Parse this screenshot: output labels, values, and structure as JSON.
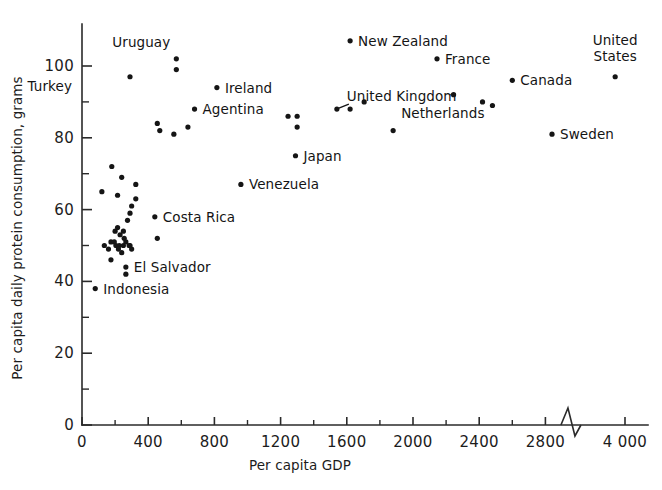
{
  "chart_data": {
    "type": "scatter",
    "title": "",
    "xlabel": "Per capita GDP",
    "ylabel": "Per capita daily protein consumption, grams",
    "xlim": [
      0,
      4000
    ],
    "ylim": [
      0,
      108
    ],
    "grid": false,
    "legend": null,
    "axis_break": {
      "axis": "x",
      "between": [
        2900,
        3700
      ],
      "style": "zigzag"
    },
    "xticks": [
      0,
      400,
      800,
      1200,
      1600,
      2000,
      2400,
      2800,
      4000
    ],
    "xtick_labels": [
      "0",
      "400",
      "800",
      "1200",
      "1600",
      "2000",
      "2400",
      "2800",
      "4 000"
    ],
    "xticks_minor": [
      200,
      600,
      1000,
      1400,
      1800,
      2200,
      2600
    ],
    "yticks": [
      0,
      20,
      40,
      60,
      80,
      100
    ],
    "ytick_labels": [
      "0",
      "20",
      "40",
      "60",
      "80",
      "100"
    ],
    "yticks_minor": [
      10,
      30,
      50,
      70,
      90
    ],
    "labeled_points": [
      {
        "label": "Turkey",
        "x": 290,
        "y": 97,
        "label_dx": -58,
        "label_dy": 14,
        "leader": false
      },
      {
        "label": "Uruguay",
        "x": 570,
        "y": 102,
        "label_dx": -6,
        "label_dy": -12,
        "leader": false
      },
      {
        "label": "Ireland",
        "x": 815,
        "y": 94,
        "label_dx": 8,
        "label_dy": 5,
        "leader": false
      },
      {
        "label": "Agentina",
        "x": 680,
        "y": 88,
        "label_dx": 8,
        "label_dy": 5,
        "leader": false
      },
      {
        "label": "Costa Rica",
        "x": 440,
        "y": 58,
        "label_dx": 8,
        "label_dy": 5,
        "leader": false
      },
      {
        "label": "El Salvador",
        "x": 265,
        "y": 44,
        "label_dx": 8,
        "label_dy": 5,
        "leader": false
      },
      {
        "label": "Indonesia",
        "x": 80,
        "y": 38,
        "label_dx": 8,
        "label_dy": 5,
        "leader": false
      },
      {
        "label": "Venezuela",
        "x": 960,
        "y": 67,
        "label_dx": 8,
        "label_dy": 5,
        "leader": false
      },
      {
        "label": "Japan",
        "x": 1290,
        "y": 75,
        "label_dx": 8,
        "label_dy": 5,
        "leader": false
      },
      {
        "label": "United Kingdom",
        "x": 1540,
        "y": 88,
        "label_dx": 10,
        "label_dy": -8,
        "leader": true
      },
      {
        "label": "Netherlands",
        "x": 1880,
        "y": 82,
        "label_dx": 8,
        "label_dy": -13,
        "leader": false
      },
      {
        "label": "New Zealand",
        "x": 1620,
        "y": 107,
        "label_dx": 8,
        "label_dy": 5,
        "leader": false
      },
      {
        "label": "France",
        "x": 2145,
        "y": 102,
        "label_dx": 8,
        "label_dy": 5,
        "leader": false
      },
      {
        "label": "Canada",
        "x": 2600,
        "y": 96,
        "label_dx": 8,
        "label_dy": 5,
        "leader": false
      },
      {
        "label": "Sweden",
        "x": 2840,
        "y": 81,
        "label_dx": 8,
        "label_dy": 5,
        "leader": false
      },
      {
        "label": "United States",
        "x": 3760,
        "y": 97,
        "label_dx": 0,
        "label_dy": -16,
        "leader": false
      }
    ],
    "unlabeled_points": [
      {
        "x": 570,
        "y": 99
      },
      {
        "x": 455,
        "y": 84
      },
      {
        "x": 470,
        "y": 82
      },
      {
        "x": 555,
        "y": 81
      },
      {
        "x": 640,
        "y": 83
      },
      {
        "x": 1245,
        "y": 86
      },
      {
        "x": 1300,
        "y": 86
      },
      {
        "x": 1300,
        "y": 83
      },
      {
        "x": 1620,
        "y": 88
      },
      {
        "x": 1705,
        "y": 90
      },
      {
        "x": 2245,
        "y": 92
      },
      {
        "x": 2420,
        "y": 90
      },
      {
        "x": 2480,
        "y": 89
      },
      {
        "x": 180,
        "y": 72
      },
      {
        "x": 240,
        "y": 69
      },
      {
        "x": 120,
        "y": 65
      },
      {
        "x": 215,
        "y": 64
      },
      {
        "x": 300,
        "y": 61
      },
      {
        "x": 325,
        "y": 67
      },
      {
        "x": 325,
        "y": 63
      },
      {
        "x": 290,
        "y": 59
      },
      {
        "x": 275,
        "y": 57
      },
      {
        "x": 200,
        "y": 54
      },
      {
        "x": 215,
        "y": 55
      },
      {
        "x": 230,
        "y": 53
      },
      {
        "x": 250,
        "y": 54
      },
      {
        "x": 255,
        "y": 52
      },
      {
        "x": 175,
        "y": 51
      },
      {
        "x": 195,
        "y": 51
      },
      {
        "x": 205,
        "y": 50
      },
      {
        "x": 225,
        "y": 50
      },
      {
        "x": 250,
        "y": 50
      },
      {
        "x": 265,
        "y": 51
      },
      {
        "x": 290,
        "y": 50
      },
      {
        "x": 300,
        "y": 49
      },
      {
        "x": 135,
        "y": 50
      },
      {
        "x": 160,
        "y": 49
      },
      {
        "x": 220,
        "y": 49
      },
      {
        "x": 240,
        "y": 48
      },
      {
        "x": 285,
        "y": 50
      },
      {
        "x": 455,
        "y": 52
      },
      {
        "x": 175,
        "y": 46
      },
      {
        "x": 265,
        "y": 42
      }
    ]
  },
  "style": {
    "ink": "#151515",
    "axis": "#2a2a2a",
    "background": "#ffffff"
  },
  "icons": {
    "axis_break": "zigzag-break-icon"
  }
}
